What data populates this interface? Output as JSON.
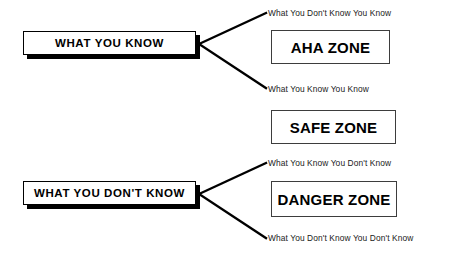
{
  "diagram": {
    "background_color": "#ffffff",
    "line_color": "#000000",
    "text_color": "#000000"
  },
  "branches": [
    {
      "id": "know",
      "heading": "WHAT YOU KNOW",
      "captions": [
        "What You Don't Know You Know",
        "What You Know You Know"
      ]
    },
    {
      "id": "dont-know",
      "heading": "WHAT YOU DON'T KNOW",
      "captions": [
        "What You Know You Don't Know",
        "What You Don't Know You Don't Know"
      ]
    }
  ],
  "zones": [
    {
      "id": "aha",
      "label": "AHA ZONE"
    },
    {
      "id": "safe",
      "label": "SAFE ZONE"
    },
    {
      "id": "danger",
      "label": "DANGER ZONE"
    }
  ]
}
